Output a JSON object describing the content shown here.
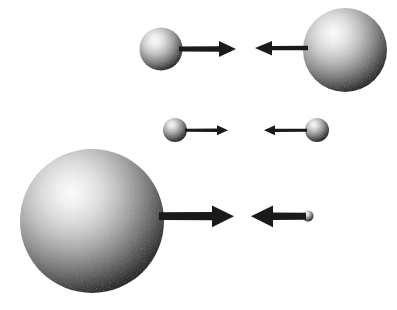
{
  "figure": {
    "width": 397,
    "height": 310,
    "background_color": "#ffffff",
    "arrow_color": "#1a1a1a",
    "sphere_highlight_color": "#f2f2f2",
    "sphere_midtone_color": "#8c8c8c",
    "sphere_shadow_color": "#1c1c1c"
  },
  "rows": [
    {
      "id": "row-1",
      "label": "Top pair: medium sphere approaching large sphere",
      "left": {
        "sphere": {
          "name": "small-sphere",
          "cx": 161,
          "cy": 49,
          "r": 21.5
        },
        "arrow": {
          "name": "arrow-right",
          "direction": "right",
          "x1": 179,
          "x2": 236,
          "y": 49,
          "shaft_width": 5.0,
          "head_length": 17,
          "head_width": 16
        }
      },
      "right": {
        "sphere": {
          "name": "large-sphere",
          "cx": 345,
          "cy": 50,
          "r": 42
        },
        "arrow": {
          "name": "arrow-left",
          "direction": "left",
          "x1": 308,
          "x2": 255,
          "y": 48,
          "shaft_width": 4.6,
          "head_length": 17,
          "head_width": 15
        }
      }
    },
    {
      "id": "row-2",
      "label": "Middle pair: two equal small spheres",
      "left": {
        "sphere": {
          "name": "tiny-sphere",
          "cx": 175,
          "cy": 130,
          "r": 12
        },
        "arrow": {
          "name": "arrow-right",
          "direction": "right",
          "x1": 185,
          "x2": 228,
          "y": 130,
          "shaft_width": 2.6,
          "head_length": 11,
          "head_width": 10
        }
      },
      "right": {
        "sphere": {
          "name": "tiny-sphere",
          "cx": 317,
          "cy": 130,
          "r": 12
        },
        "arrow": {
          "name": "arrow-left",
          "direction": "left",
          "x1": 307,
          "x2": 264,
          "y": 130,
          "shaft_width": 2.6,
          "head_length": 11,
          "head_width": 10
        }
      }
    },
    {
      "id": "row-3",
      "label": "Bottom pair: very large sphere approaching minute sphere",
      "left": {
        "sphere": {
          "name": "very-large-sphere",
          "cx": 92,
          "cy": 221,
          "r": 72
        },
        "arrow": {
          "name": "arrow-right",
          "direction": "right",
          "x1": 161,
          "x2": 234,
          "y": 216,
          "shaft_width": 7.5,
          "head_length": 22,
          "head_width": 22
        }
      },
      "right": {
        "sphere": {
          "name": "minute-sphere",
          "cx": 308,
          "cy": 216,
          "r": 5.5
        },
        "arrow": {
          "name": "arrow-left",
          "direction": "left",
          "x1": 305,
          "x2": 251,
          "y": 216,
          "shaft_width": 7.0,
          "head_length": 22,
          "head_width": 22
        }
      }
    }
  ],
  "chart_data": {
    "type": "diagram",
    "pairs": [
      {
        "row": 1,
        "left_sphere_radius_px": 21.5,
        "left_arrow_direction": "right",
        "left_arrow_length_px": 57,
        "right_sphere_radius_px": 42,
        "right_arrow_direction": "left",
        "right_arrow_length_px": 53
      },
      {
        "row": 2,
        "left_sphere_radius_px": 12,
        "left_arrow_direction": "right",
        "left_arrow_length_px": 43,
        "right_sphere_radius_px": 12,
        "right_arrow_direction": "left",
        "right_arrow_length_px": 43
      },
      {
        "row": 3,
        "left_sphere_radius_px": 72,
        "left_arrow_direction": "right",
        "left_arrow_length_px": 73,
        "right_sphere_radius_px": 5.5,
        "right_arrow_direction": "left",
        "right_arrow_length_px": 54
      }
    ]
  }
}
